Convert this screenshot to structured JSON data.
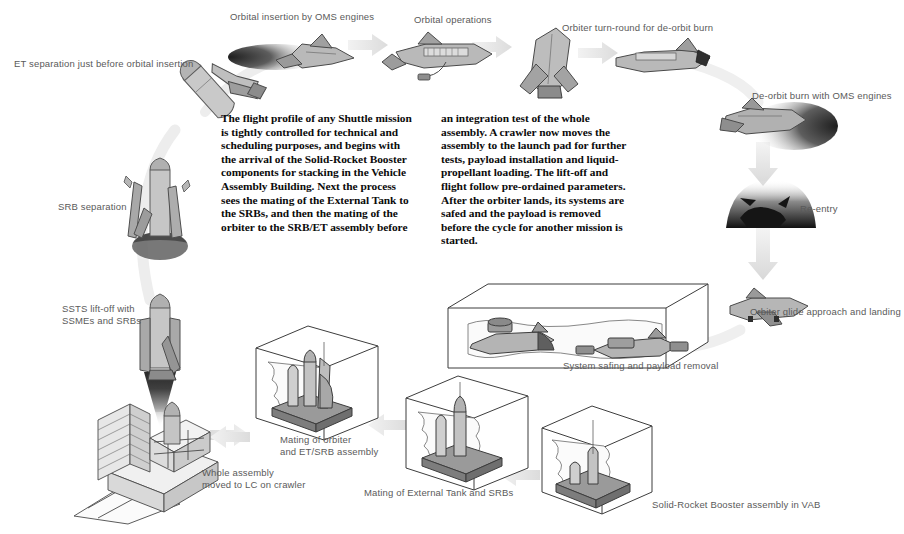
{
  "figure": {
    "domain": "diagram",
    "title_text_columns": [
      "The flight profile of any Shuttle mission is tightly controlled for technical and scheduling purposes, and begins with the arrival of the Solid-Rocket Booster components for stacking in the Vehicle Assembly Building. Next the process sees the mating of the External Tank to the SRBs, and then the mating of the orbiter to the SRB/ET assembly before",
      "an integration test of the whole assembly. A crawler now moves the assembly to the launch pad for further tests, payload installation and liquid-propellant loading. The lift-off and flight follow pre-ordained parameters. After the orbiter lands, its systems are safed and the payload is removed before the cycle for another mission is started."
    ],
    "background": "#ffffff",
    "label_color": "#5a5a5a",
    "body_text_color": "#0b0b0b"
  },
  "labels": {
    "et_separation": "ET separation just before orbital insertion",
    "orbital_insertion": "Orbital insertion by OMS engines",
    "orbital_operations": "Orbital operations",
    "orbiter_turnround": "Orbiter turn-round for de-orbit burn",
    "deorbit_burn": "De-orbit burn with OMS engines",
    "reentry": "Re-entry",
    "glide_landing": "Orbiter glide approach and landing",
    "system_safing": "System safing and payload removal",
    "srb_separation": "SRB separation",
    "ssts_liftoff": "SSTS lift-off with\nSSMEs and SRBs",
    "whole_assembly": "Whole assembly\nmoved to LC on crawler",
    "mating_orbiter": "Mating of orbiter\nand ET/SRB assembly",
    "mating_et_srb": "Mating of External Tank and SRBs",
    "srb_assembly_vab": "Solid-Rocket Booster assembly in VAB"
  },
  "stages": [
    {
      "id": "srb-assembly-vab",
      "order": 1,
      "label": "Solid-Rocket Booster assembly in VAB"
    },
    {
      "id": "mating-et-srb",
      "order": 2,
      "label": "Mating of External Tank and SRBs"
    },
    {
      "id": "mating-orbiter",
      "order": 3,
      "label": "Mating of orbiter and ET/SRB assembly"
    },
    {
      "id": "whole-assembly",
      "order": 4,
      "label": "Whole assembly moved to LC on crawler"
    },
    {
      "id": "ssts-liftoff",
      "order": 5,
      "label": "SSTS lift-off with SSMEs and SRBs"
    },
    {
      "id": "srb-separation",
      "order": 6,
      "label": "SRB separation"
    },
    {
      "id": "et-separation",
      "order": 7,
      "label": "ET separation just before orbital insertion"
    },
    {
      "id": "orbital-insertion",
      "order": 8,
      "label": "Orbital insertion by OMS engines"
    },
    {
      "id": "orbital-operations",
      "order": 9,
      "label": "Orbital operations"
    },
    {
      "id": "orbiter-turnround",
      "order": 10,
      "label": "Orbiter turn-round for de-orbit burn"
    },
    {
      "id": "deorbit-burn",
      "order": 11,
      "label": "De-orbit burn with OMS engines"
    },
    {
      "id": "reentry",
      "order": 12,
      "label": "Re-entry"
    },
    {
      "id": "glide-landing",
      "order": 13,
      "label": "Orbiter glide approach and landing"
    },
    {
      "id": "system-safing",
      "order": 14,
      "label": "System safing and payload removal"
    }
  ]
}
